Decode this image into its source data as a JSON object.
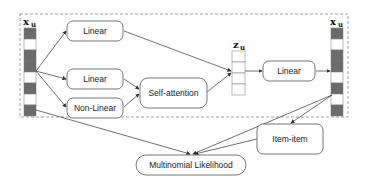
{
  "diagram": {
    "input_vector": {
      "label": "x",
      "subscript": "u",
      "cells": [
        "filled",
        "empty",
        "filled",
        "filled",
        "empty",
        "filled",
        "empty",
        "filled"
      ]
    },
    "output_vector": {
      "label": "x",
      "subscript": "u",
      "cells": [
        "filled",
        "empty",
        "filled",
        "filled",
        "empty",
        "filled",
        "empty",
        "filled"
      ]
    },
    "latent_vector": {
      "label": "z",
      "subscript": "u",
      "cells": 4
    },
    "nodes": {
      "linear_top": "Linear",
      "linear_mid": "Linear",
      "non_linear": "Non-Linear",
      "self_attention": "Self-attention",
      "linear_out": "Linear",
      "item_item": "Item-item",
      "multinomial": "Multinomial Likelihood"
    },
    "colors": {
      "filled_cell": "#6b6b6b",
      "empty_cell": "#ffffff",
      "stroke": "#555555",
      "dashed_border": "#888888"
    }
  }
}
